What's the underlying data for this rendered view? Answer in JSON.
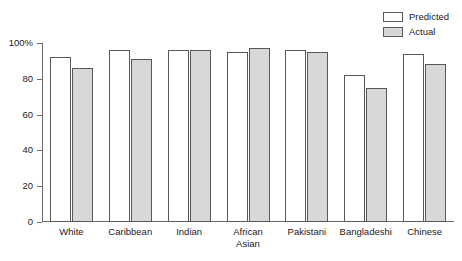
{
  "chart_data": {
    "type": "bar",
    "title": "",
    "subtitle": "",
    "xlabel": "",
    "ylabel": "",
    "ylim": [
      0,
      100
    ],
    "yticks": [
      0,
      20,
      40,
      60,
      80,
      100
    ],
    "ytick_labels": [
      "0",
      "20",
      "40",
      "60",
      "80",
      "100%"
    ],
    "grid": false,
    "legend_position": "top-right",
    "categories": [
      "White",
      "Caribbean",
      "Indian",
      "African\nAsian",
      "Pakistani",
      "Bangladeshi",
      "Chinese"
    ],
    "series": [
      {
        "name": "Predicted",
        "color": "#ffffff",
        "values": [
          92,
          96,
          96,
          95,
          96,
          82,
          94
        ]
      },
      {
        "name": "Actual",
        "color": "#d8d8d8",
        "values": [
          86,
          91,
          96,
          97,
          95,
          75,
          88
        ]
      }
    ]
  },
  "legend": {
    "items": [
      {
        "label": "Predicted",
        "swatch": "predicted-swatch"
      },
      {
        "label": "Actual",
        "swatch": "actual-swatch"
      }
    ]
  },
  "axis": {
    "y_tick_labels": [
      "100%",
      "80",
      "60",
      "40",
      "20",
      "0"
    ]
  },
  "colors": {
    "predicted_fill": "#ffffff",
    "actual_fill": "#d8d8d8",
    "outline": "#585858",
    "axis": "#6b6b6b",
    "text": "#1a1a1a",
    "background": "#ffffff"
  }
}
